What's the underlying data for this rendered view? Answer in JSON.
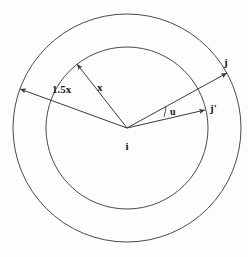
{
  "figure": {
    "type": "geometric-diagram",
    "background_color": "#fdfdfd",
    "stroke_color": "#4a4a52",
    "text_color": "#1a1a1a",
    "center": {
      "label": "i",
      "x": 127,
      "y": 128
    },
    "circles": [
      {
        "name": "outer-circle",
        "radius": 114,
        "label_ref": "1.5x"
      },
      {
        "name": "inner-circle",
        "radius": 81,
        "label_ref": "x"
      }
    ],
    "vectors": [
      {
        "name": "radius-outer-vector",
        "label": "1.5x",
        "from": "i",
        "to_radius": 114,
        "angle_deg": 160,
        "arrow": "end",
        "label_x": 52,
        "label_y": 93
      },
      {
        "name": "radius-inner-vector",
        "label": "x",
        "from": "i",
        "to_radius": 81,
        "angle_deg": 128,
        "arrow": "end",
        "label_x": 97,
        "label_y": 91
      },
      {
        "name": "vector-to-j",
        "label": "j",
        "from": "i",
        "to_radius": 114,
        "angle_deg": 29,
        "arrow": "end",
        "label_x": 221,
        "label_y": 65
      },
      {
        "name": "vector-to-j-prime",
        "label": "j'",
        "from": "i",
        "to_radius": 93,
        "angle_deg": 10,
        "arrow": "end",
        "label_x": 211,
        "label_y": 111
      }
    ],
    "angle_marks": [
      {
        "name": "angle-u",
        "label": "u",
        "between": [
          "vector-to-j",
          "vector-to-j-prime"
        ],
        "label_x": 171,
        "label_y": 111
      }
    ],
    "labels": {
      "center": "i",
      "outer_radius": "1.5x",
      "inner_radius": "x",
      "node_j": "j",
      "node_j_prime": "j'",
      "angle": "u"
    }
  }
}
